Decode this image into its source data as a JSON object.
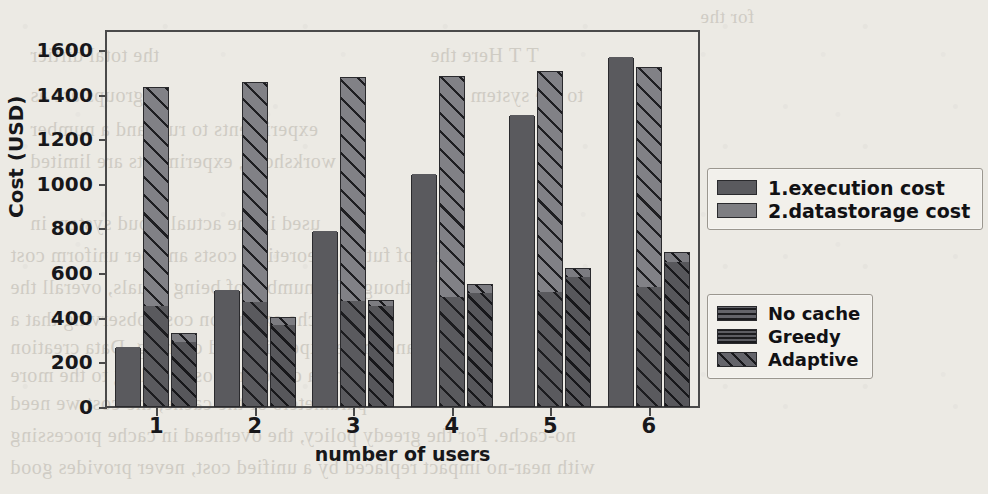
{
  "page": {
    "background_color": "#eceae4",
    "bleed_text": [
      {
        "text": "for the",
        "x": 700,
        "y": 6,
        "size": 19
      },
      {
        "text": "the total dirtier",
        "x": 30,
        "y": 44,
        "size": 20
      },
      {
        "text": "T  T  Here the",
        "x": 430,
        "y": 44,
        "size": 20
      },
      {
        "text": "groups are as",
        "x": 30,
        "y": 84,
        "size": 20
      },
      {
        "text": "to the system",
        "x": 470,
        "y": 84,
        "size": 20
      },
      {
        "text": "experiments to run, and a number",
        "x": 30,
        "y": 118,
        "size": 20
      },
      {
        "text": "workshops, experiments are limited",
        "x": 30,
        "y": 150,
        "size": 20
      },
      {
        "text": "used in the actual cloud system in",
        "x": 30,
        "y": 212,
        "size": 20
      },
      {
        "text": "size of future theoretical costs and per uniform cost",
        "x": 10,
        "y": 244,
        "size": 20
      },
      {
        "text": "Although the number of being equals, overall the",
        "x": 10,
        "y": 276,
        "size": 20
      },
      {
        "text": "cache execution cost, observing that a",
        "x": 10,
        "y": 308,
        "size": 20
      },
      {
        "text": "and more expensive and caching. Data creation",
        "x": 10,
        "y": 336,
        "size": 20
      },
      {
        "text": "and a different cost, leading to the more",
        "x": 10,
        "y": 364,
        "size": 20
      },
      {
        "text": "parameters of the cache, the cost we need",
        "x": 10,
        "y": 392,
        "size": 20
      },
      {
        "text": "no-cache. For the greedy policy, the overhead in cache processing",
        "x": 10,
        "y": 424,
        "size": 20
      },
      {
        "text": "with near-no impact replaced by a unified cost, never provides good",
        "x": 10,
        "y": 456,
        "size": 20
      }
    ]
  },
  "chart_data": {
    "type": "bar",
    "title": "",
    "xlabel": "number of users",
    "ylabel": "Cost (USD)",
    "categories": [
      "1",
      "2",
      "3",
      "4",
      "5",
      "6"
    ],
    "ylim": [
      0,
      1680
    ],
    "yticks": [
      0,
      200,
      400,
      600,
      800,
      1000,
      1200,
      1400,
      1600
    ],
    "xticks": [
      "1",
      "2",
      "3",
      "4",
      "5",
      "6"
    ],
    "grid": false,
    "stacked": true,
    "cost_components": [
      {
        "key": "execution",
        "label": "1.execution cost",
        "color": "#5a5a5e"
      },
      {
        "key": "datastorage",
        "label": "2.datastorage cost",
        "color": "#818186"
      }
    ],
    "methods": [
      {
        "key": "no_cache",
        "label": "No cache",
        "pattern": "solid"
      },
      {
        "key": "greedy",
        "label": "Greedy",
        "pattern": "horizontal-lines"
      },
      {
        "key": "adaptive",
        "label": "Adaptive",
        "pattern": "diagonal-hatch"
      }
    ],
    "series": [
      {
        "method": "No cache",
        "component": "1.execution cost",
        "values": [
          265,
          520,
          785,
          1040,
          1305,
          1565
        ]
      },
      {
        "method": "No cache",
        "component": "2.datastorage cost",
        "values": [
          0,
          0,
          0,
          0,
          0,
          0
        ]
      },
      {
        "method": "Greedy",
        "component": "1.execution cost",
        "values": [
          450,
          465,
          470,
          490,
          510,
          535
        ]
      },
      {
        "method": "Greedy",
        "component": "2.datastorage cost",
        "values": [
          985,
          990,
          1010,
          995,
          995,
          990
        ]
      },
      {
        "method": "Adaptive",
        "component": "1.execution cost",
        "values": [
          285,
          365,
          450,
          505,
          580,
          645
        ]
      },
      {
        "method": "Adaptive",
        "component": "2.datastorage cost",
        "values": [
          45,
          40,
          30,
          45,
          45,
          50
        ]
      }
    ],
    "totals": {
      "no_cache": [
        265,
        520,
        785,
        1040,
        1305,
        1565
      ],
      "greedy": [
        1435,
        1455,
        1480,
        1485,
        1505,
        1525
      ],
      "adaptive": [
        330,
        405,
        480,
        550,
        625,
        695
      ]
    }
  },
  "legends": {
    "cost": {
      "items": [
        {
          "label": "1.execution cost",
          "swatch": "solid-dark"
        },
        {
          "label": "2.datastorage cost",
          "swatch": "solid-mid"
        }
      ]
    },
    "method": {
      "items": [
        {
          "label": "No cache",
          "swatch": "solid"
        },
        {
          "label": "Greedy",
          "swatch": "horizontal-lines"
        },
        {
          "label": "Adaptive",
          "swatch": "diagonal-hatch"
        }
      ]
    }
  }
}
